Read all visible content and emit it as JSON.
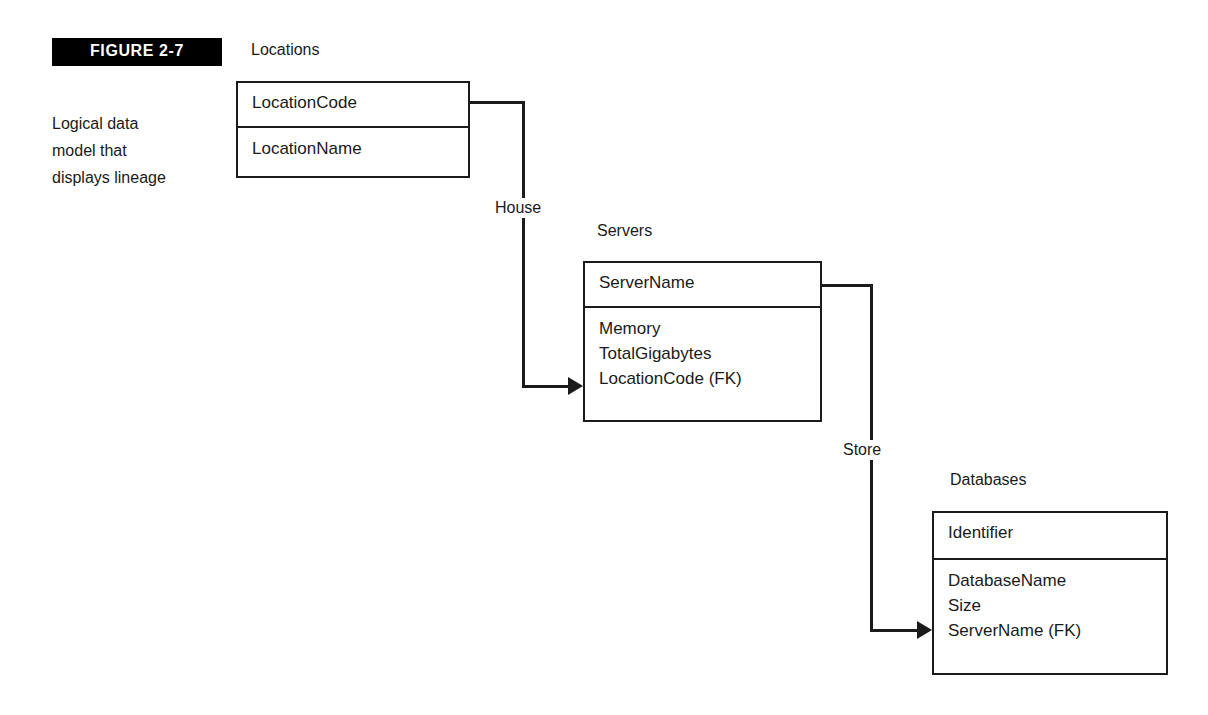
{
  "figure": {
    "badge_label": "FIGURE  2-7",
    "caption_lines": [
      "Logical data",
      "model that",
      "displays lineage"
    ]
  },
  "entities": [
    {
      "id": "locations",
      "title": "Locations",
      "key_attribute": "LocationCode",
      "attributes": [
        "LocationName"
      ]
    },
    {
      "id": "servers",
      "title": "Servers",
      "key_attribute": "ServerName",
      "attributes": [
        "Memory",
        "TotalGigabytes",
        "LocationCode (FK)"
      ]
    },
    {
      "id": "databases",
      "title": "Databases",
      "key_attribute": "Identifier",
      "attributes": [
        "DatabaseName",
        "Size",
        "ServerName (FK)"
      ]
    }
  ],
  "relationships": [
    {
      "id": "house",
      "label": "House",
      "from": "locations",
      "to": "servers"
    },
    {
      "id": "store",
      "label": "Store",
      "from": "servers",
      "to": "databases"
    }
  ],
  "colors": {
    "ink": "#1b1b1b",
    "badge_background": "#000000",
    "badge_text": "#ffffff",
    "page_background": "#ffffff"
  }
}
